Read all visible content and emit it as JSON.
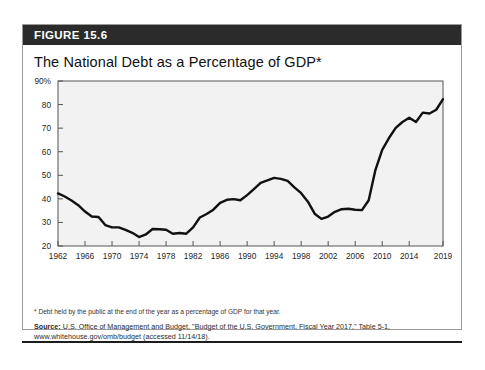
{
  "figure": {
    "header_label": "FIGURE 15.6",
    "title": "The National Debt as a Percentage of GDP*",
    "footnote": "* Debt held by the public at the end of the year as a percentage of GDP for that year.",
    "source_label": "Source:",
    "source_text": " U.S. Office of Management and Budget, \"Budget of the U.S. Government, Fiscal Year 2017,\" Table 5-1,",
    "source_line2": "www.whitehouse.gov/omb/budget (accessed 11/14/18)."
  },
  "colors": {
    "header_bar": "#2b2b2b",
    "card_border": "#9a9a9a",
    "plot_border": "#555555",
    "line": "#111111",
    "plot_background": "#f2f2f2",
    "tick": "#555555"
  },
  "chart_data": {
    "type": "line",
    "title": "The National Debt as a Percentage of GDP*",
    "xlabel": "",
    "ylabel": "",
    "xlim": [
      1962,
      2019
    ],
    "ylim": [
      20,
      90
    ],
    "yticks": [
      20,
      30,
      40,
      50,
      60,
      70,
      80,
      90
    ],
    "ytick_labels": [
      "20",
      "30",
      "40",
      "50",
      "60",
      "70",
      "80",
      "90%"
    ],
    "xticks": [
      1962,
      1966,
      1970,
      1974,
      1978,
      1982,
      1986,
      1990,
      1994,
      1998,
      2002,
      2006,
      2010,
      2014,
      2019
    ],
    "xtick_labels": [
      "1962",
      "1966",
      "1970",
      "1974",
      "1978",
      "1982",
      "1986",
      "1990",
      "1994",
      "1998",
      "2002",
      "2006",
      "2010",
      "2014",
      "2019"
    ],
    "grid": false,
    "legend": false,
    "series": [
      {
        "name": "Debt held by the public (% of GDP)",
        "x": [
          1962,
          1963,
          1964,
          1965,
          1966,
          1967,
          1968,
          1969,
          1970,
          1971,
          1972,
          1973,
          1974,
          1975,
          1976,
          1977,
          1978,
          1979,
          1980,
          1981,
          1982,
          1983,
          1984,
          1985,
          1986,
          1987,
          1988,
          1989,
          1990,
          1991,
          1992,
          1993,
          1994,
          1995,
          1996,
          1997,
          1998,
          1999,
          2000,
          2001,
          2002,
          2003,
          2004,
          2005,
          2006,
          2007,
          2008,
          2009,
          2010,
          2011,
          2012,
          2013,
          2014,
          2015,
          2016,
          2017,
          2018,
          2019
        ],
        "y": [
          42.3,
          41.0,
          39.3,
          37.3,
          34.6,
          32.5,
          32.3,
          28.9,
          27.9,
          27.9,
          26.8,
          25.6,
          23.8,
          24.9,
          27.2,
          27.1,
          26.9,
          25.2,
          25.5,
          25.2,
          27.9,
          32.1,
          33.6,
          35.4,
          38.3,
          39.6,
          39.9,
          39.4,
          41.6,
          44.1,
          46.8,
          47.8,
          48.9,
          48.5,
          47.6,
          44.9,
          42.4,
          38.8,
          33.7,
          31.5,
          32.5,
          34.5,
          35.6,
          35.8,
          35.4,
          35.2,
          39.4,
          52.3,
          60.8,
          65.8,
          70.1,
          72.6,
          74.4,
          72.6,
          76.6,
          76.2,
          77.8,
          82.3
        ]
      }
    ]
  }
}
